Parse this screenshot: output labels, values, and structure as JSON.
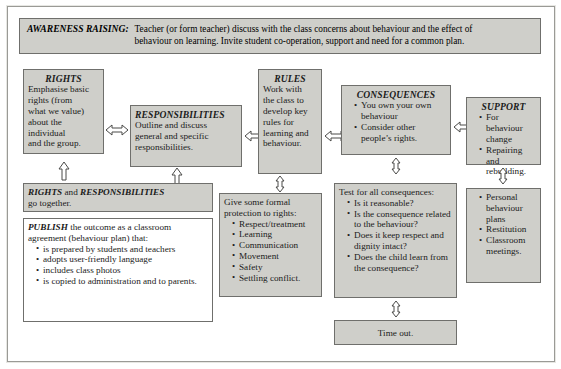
{
  "header": {
    "label": "AWARENESS RAISING:",
    "line1": "Teacher (or form teacher) discuss with the class concerns about behaviour and the effect of",
    "line2": "behaviour on learning. Invite student co-operation, support and need for a common plan."
  },
  "boxes": {
    "rights": {
      "title": "RIGHTS",
      "lines": [
        "Emphasise basic",
        "rights (from",
        "what we value)",
        "about the",
        "individual",
        "and the group."
      ]
    },
    "responsibilities": {
      "title": "RESPONSIBILITIES",
      "lines": [
        "Outline and discuss",
        "general and specific",
        "responsibilities."
      ]
    },
    "rules": {
      "title": "RULES",
      "lines": [
        "Work with",
        "the class to",
        "develop key",
        "rules for",
        "learning and",
        "behaviour."
      ]
    },
    "consequences": {
      "title": "CONSEQUENCES",
      "items": [
        "You own your own behaviour",
        "Consider other people’s rights."
      ]
    },
    "support": {
      "title": "SUPPORT",
      "items": [
        "For behaviour change",
        "Repairing and rebuilding."
      ]
    },
    "rights_and_responsibilities": {
      "strong1": "RIGHTS",
      "mid": " and ",
      "strong2": "RESPONSIBILITIES",
      "line2": "go together."
    },
    "publish": {
      "strong": "PUBLISH",
      "intro": " the outcome as a classroom agreement (behaviour plan) that:",
      "items": [
        "is prepared by students and teachers",
        "adopts user-friendly language",
        "includes class photos",
        "is copied to administration and to parents."
      ]
    },
    "formal_protection": {
      "intro_line1": "Give some formal",
      "intro_line2": "protection to rights:",
      "items": [
        "Respect/treatment",
        "Learning",
        "Communication",
        "Movement",
        "Safety",
        "Settling conflict."
      ]
    },
    "test_consequences": {
      "intro": "Test for all consequences:",
      "items": [
        "Is it reasonable?",
        "Is the consequence related to the behaviour?",
        "Does it keep respect and dignity intact?",
        "Does the child learn from the consequence?"
      ]
    },
    "support_strategies": {
      "items": [
        "Personal behaviour plans",
        "Restitution",
        "Classroom meetings."
      ]
    },
    "time_out": {
      "label": "Time out."
    }
  },
  "colors": {
    "box_fill": "#cfcfca",
    "box_border": "#6f6f6c",
    "page_bg": "#ffffff",
    "text": "#1b1b1b"
  }
}
